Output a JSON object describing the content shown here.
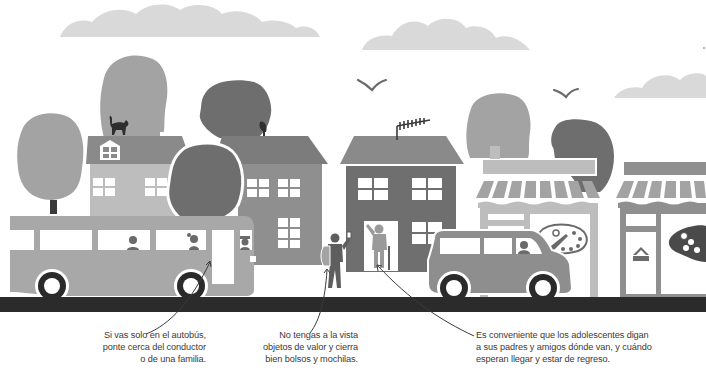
{
  "illustration": {
    "subject": "street-safety-scene",
    "colors": {
      "background": "#ffffff",
      "cloud": "#d9d9d9",
      "tree_light": "#a3a3a3",
      "tree_dark": "#6e6e6e",
      "building_light": "#bdbdbd",
      "building_mid": "#8f8f8f",
      "building_dark": "#6f6f6f",
      "roof": "#8a8a8a",
      "bus": "#a8a8a8",
      "van": "#8e8e8e",
      "road": "#2b2b2b",
      "wheel": "#2a2a2a",
      "window": "#ffffff",
      "figure": "#5e5e5e",
      "annotation_line": "#3a3a3a",
      "text": "#3a3a3a"
    },
    "elements": [
      "clouds",
      "birds",
      "trees",
      "house-with-cat",
      "house-with-satellite-dish",
      "house-with-antenna",
      "art-shop",
      "game-shop",
      "bus",
      "van",
      "teen-with-backpack",
      "elderly-man-in-doorway",
      "road"
    ]
  },
  "captions": {
    "bus": {
      "lines": [
        "Si vas solo en el autobús,",
        "ponte cerca del conductor",
        "o de una familia."
      ]
    },
    "valuables": {
      "lines": [
        "No tengas a la vista",
        "objetos de valor y cierra",
        "bien bolsos y mochilas."
      ]
    },
    "teens": {
      "lines": [
        "Es conveniente que los adolescentes digan",
        "a sus padres y amigos dónde van, y cuándo",
        "esperan llegar y estar de regreso."
      ]
    }
  }
}
